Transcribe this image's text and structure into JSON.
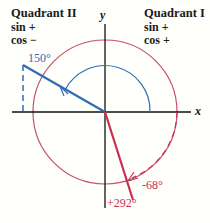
{
  "quadrants": {
    "q2": {
      "title": "Quadrant II",
      "sin": "sin +",
      "cos": "cos −"
    },
    "q1": {
      "title": "Quadrant I",
      "sin": "sin +",
      "cos": "cos +"
    }
  },
  "axes": {
    "x": "x",
    "y": "y"
  },
  "angles": {
    "a150": "150°",
    "neg68": "-68°",
    "pos292": "+292°"
  },
  "colors": {
    "blue": "#2e6db4",
    "red": "#c8304e",
    "axis": "#111111"
  }
}
